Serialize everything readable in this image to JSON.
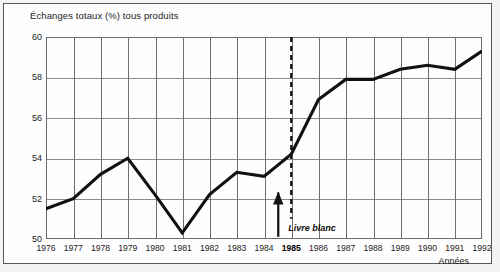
{
  "figure": {
    "title": "Échanges totaux (%) tous produits",
    "x_axis_title": "Années",
    "annotation_label": "Livre blanc",
    "line_color": "#111111",
    "grid_color": "#8b8b8d",
    "frame_color": "#58585a"
  },
  "chart_data": {
    "type": "line",
    "title": "Échanges totaux (%) tous produits",
    "xlabel": "Années",
    "ylabel": "",
    "ylim": [
      50,
      60
    ],
    "yticks": [
      50,
      52,
      54,
      56,
      58,
      60
    ],
    "ytick_labels": [
      "50",
      "52",
      "54",
      "56",
      "58",
      "60"
    ],
    "grid": true,
    "legend": null,
    "categories": [
      "1976",
      "1977",
      "1978",
      "1979",
      "1980",
      "1981",
      "1982",
      "1983",
      "1984",
      "1985",
      "1986",
      "1987",
      "1988",
      "1989",
      "1990",
      "1991",
      "1992"
    ],
    "xtick_labels": [
      "1976",
      "1977",
      "1978",
      "1979",
      "1980",
      "1981",
      "1982",
      "1983",
      "1984",
      "1985",
      "1986",
      "1987",
      "1988",
      "1989",
      "1990",
      "1991",
      "1992"
    ],
    "highlighted_xtick": "1985",
    "values": [
      51.5,
      52.0,
      53.2,
      54.0,
      52.2,
      50.3,
      52.2,
      53.3,
      53.1,
      54.2,
      56.9,
      57.9,
      57.9,
      58.4,
      58.6,
      58.4,
      59.3
    ],
    "annotations": [
      {
        "label": "Livre blanc",
        "x": "1985",
        "type": "vertical-dashed-line-with-arrow",
        "arrow_from_y": 51.0,
        "arrow_to_y": 52.3,
        "dash_top_y": 60.0,
        "dash_bottom_y": 51.0
      }
    ]
  }
}
